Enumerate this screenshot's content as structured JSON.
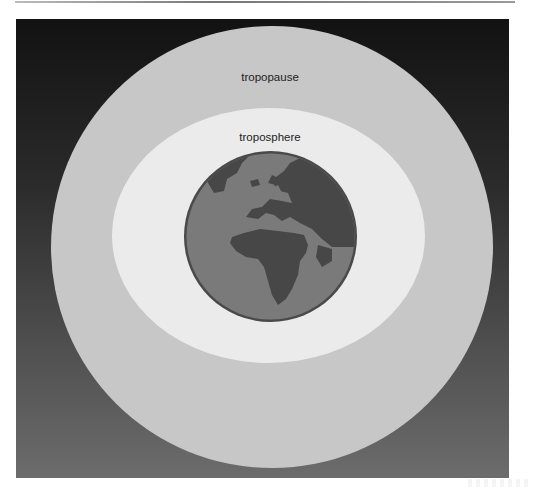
{
  "diagram": {
    "layers": [
      {
        "name": "tropopause",
        "label": "tropopause",
        "color": "#c7c7c7"
      },
      {
        "name": "troposphere",
        "label": "troposphere",
        "color": "#ebebeb"
      }
    ],
    "center": {
      "name": "earth",
      "icon": "globe-icon",
      "ocean_color": "#7a7a7a",
      "land_color": "#474747",
      "rim_color": "#4a4a4a"
    },
    "background": {
      "top_color": "#121212",
      "bottom_color": "#6c6c6c"
    }
  }
}
